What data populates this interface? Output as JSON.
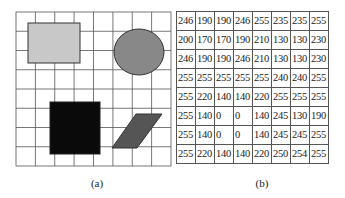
{
  "figure": {
    "panel_a": {
      "caption": "(a)",
      "grid": {
        "rows": 8,
        "cols": 8,
        "line_color": "#555555"
      },
      "shapes": [
        {
          "type": "rectangle",
          "fill": "#c8c8c8",
          "stroke": "#333333"
        },
        {
          "type": "ellipse",
          "fill": "#888888",
          "stroke": "#333333"
        },
        {
          "type": "square",
          "fill": "#0a0a0a",
          "stroke": "#222222"
        },
        {
          "type": "parallelogram",
          "fill": "#555555",
          "stroke": "#333333"
        }
      ]
    },
    "panel_b": {
      "caption": "(b)",
      "rows": [
        [
          "246",
          "190",
          "190",
          "246",
          "255",
          "235",
          "235",
          "255"
        ],
        [
          "200",
          "170",
          "170",
          "190",
          "210",
          "130",
          "130",
          "230"
        ],
        [
          "246",
          "190",
          "190",
          "246",
          "210",
          "130",
          "130",
          "230"
        ],
        [
          "255",
          "255",
          "255",
          "255",
          "255",
          "240",
          "240",
          "255"
        ],
        [
          "255",
          "220",
          "140",
          "140",
          "220",
          "255",
          "255",
          "255"
        ],
        [
          "255",
          "140",
          "0",
          "0",
          "140",
          "245",
          "130",
          "190"
        ],
        [
          "255",
          "140",
          "0",
          "0",
          "140",
          "245",
          "245",
          "255"
        ],
        [
          "255",
          "220",
          "140",
          "140",
          "220",
          "250",
          "254",
          "255"
        ]
      ]
    }
  }
}
